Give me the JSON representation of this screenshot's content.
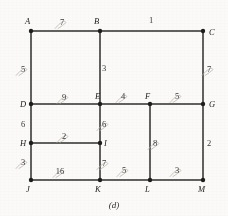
{
  "figure": {
    "caption": "(d)",
    "nodes": [
      {
        "id": "A",
        "label": "A",
        "x": 31,
        "y": 31,
        "lx": 25,
        "ly": 24
      },
      {
        "id": "B",
        "label": "B",
        "x": 100,
        "y": 31,
        "lx": 94,
        "ly": 24
      },
      {
        "id": "C",
        "label": "C",
        "x": 203,
        "y": 31,
        "lx": 209,
        "ly": 35
      },
      {
        "id": "D",
        "label": "D",
        "x": 31,
        "y": 104,
        "lx": 20,
        "ly": 107
      },
      {
        "id": "E",
        "label": "E",
        "x": 100,
        "y": 104,
        "lx": 95,
        "ly": 99
      },
      {
        "id": "F",
        "label": "F",
        "x": 150,
        "y": 104,
        "lx": 145,
        "ly": 99
      },
      {
        "id": "G",
        "label": "G",
        "x": 203,
        "y": 104,
        "lx": 209,
        "ly": 107
      },
      {
        "id": "H",
        "label": "H",
        "x": 31,
        "y": 143,
        "lx": 20,
        "ly": 146
      },
      {
        "id": "I",
        "label": "I",
        "x": 100,
        "y": 143,
        "lx": 104,
        "ly": 146
      },
      {
        "id": "J",
        "label": "J",
        "x": 31,
        "y": 180,
        "lx": 26,
        "ly": 192
      },
      {
        "id": "K",
        "label": "K",
        "x": 100,
        "y": 180,
        "lx": 95,
        "ly": 192
      },
      {
        "id": "L",
        "label": "L",
        "x": 150,
        "y": 180,
        "lx": 145,
        "ly": 192
      },
      {
        "id": "M",
        "label": "M",
        "x": 203,
        "y": 180,
        "lx": 198,
        "ly": 192
      }
    ],
    "edges": [
      {
        "from": "A",
        "to": "B",
        "weight": "7",
        "wx": 62,
        "wy": 25,
        "struck": true
      },
      {
        "from": "B",
        "to": "C",
        "weight": "1",
        "wx": 151,
        "wy": 23,
        "struck": false
      },
      {
        "from": "A",
        "to": "D",
        "weight": "5",
        "wx": 23,
        "wy": 72,
        "struck": true
      },
      {
        "from": "B",
        "to": "E",
        "weight": "3",
        "wx": 104,
        "wy": 71,
        "struck": false
      },
      {
        "from": "C",
        "to": "G",
        "weight": "7",
        "wx": 209,
        "wy": 72,
        "struck": true
      },
      {
        "from": "D",
        "to": "E",
        "weight": "9",
        "wx": 64,
        "wy": 100,
        "struck": true
      },
      {
        "from": "E",
        "to": "F",
        "weight": "4",
        "wx": 123,
        "wy": 99,
        "struck": true
      },
      {
        "from": "F",
        "to": "G",
        "weight": "5",
        "wx": 177,
        "wy": 99,
        "struck": true
      },
      {
        "from": "D",
        "to": "H",
        "weight": "6",
        "wx": 23,
        "wy": 127,
        "struck": false
      },
      {
        "from": "E",
        "to": "I",
        "weight": "6",
        "wx": 104,
        "wy": 127,
        "struck": true
      },
      {
        "from": "F",
        "to": "L",
        "weight": "8",
        "wx": 155,
        "wy": 146,
        "struck": true
      },
      {
        "from": "G",
        "to": "M",
        "weight": "2",
        "wx": 209,
        "wy": 146,
        "struck": false
      },
      {
        "from": "H",
        "to": "I",
        "weight": "2",
        "wx": 64,
        "wy": 139,
        "struck": true
      },
      {
        "from": "H",
        "to": "J",
        "weight": "3",
        "wx": 23,
        "wy": 165,
        "struck": true
      },
      {
        "from": "I",
        "to": "K",
        "weight": "7",
        "wx": 104,
        "wy": 166,
        "struck": true
      },
      {
        "from": "J",
        "to": "K",
        "weight": "16",
        "wx": 60,
        "wy": 174,
        "struck": true
      },
      {
        "from": "K",
        "to": "L",
        "weight": "5",
        "wx": 124,
        "wy": 173,
        "struck": true
      },
      {
        "from": "L",
        "to": "M",
        "weight": "3",
        "wx": 177,
        "wy": 173,
        "struck": true
      }
    ]
  }
}
